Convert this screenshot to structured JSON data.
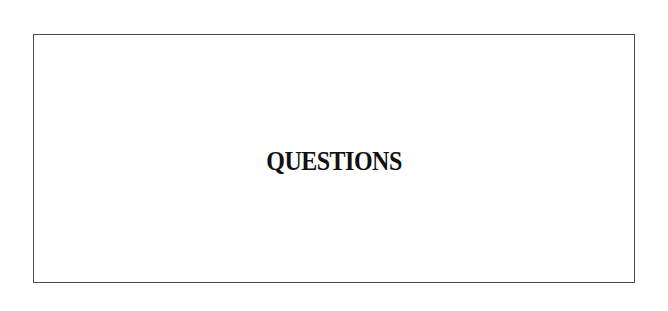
{
  "page": {
    "heading": "QUESTIONS"
  },
  "colors": {
    "background": "#ffffff",
    "border": "#4a4a4a",
    "text": "#111111"
  }
}
